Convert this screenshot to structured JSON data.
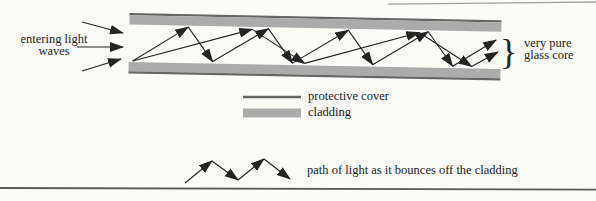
{
  "figure": {
    "entering_label": {
      "line1": "entering light",
      "line2": "waves"
    },
    "core_label": {
      "line1": "very pure",
      "line2": "glass core"
    },
    "brace": "}"
  },
  "legend": {
    "protective_cover": "protective cover",
    "cladding": "cladding",
    "light_path": "path of light as it bounces off the cladding"
  },
  "colors": {
    "ink": "#242424",
    "cladding": "#ababab",
    "protective_cover": "#666666",
    "rule": "#5a5a5a",
    "page_bg": "#fbfbf8"
  }
}
